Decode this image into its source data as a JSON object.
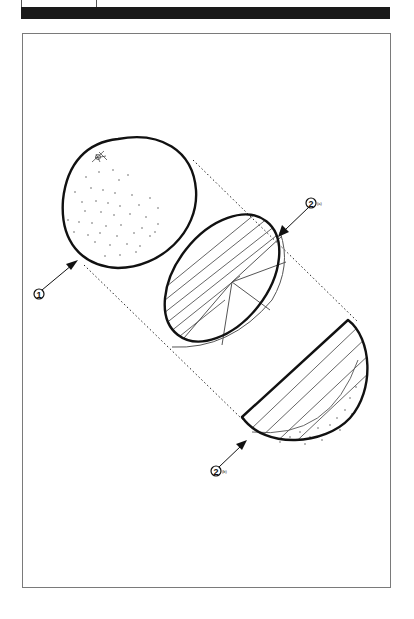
{
  "figure": {
    "callouts": [
      {
        "id": "callout-1",
        "number": "1",
        "suffix": "",
        "target": "whole orange"
      },
      {
        "id": "callout-2a",
        "number": "2",
        "suffix": "(a)",
        "target": "sliced cross-section"
      },
      {
        "id": "callout-2b",
        "number": "2",
        "suffix": "(b)",
        "target": "half wedge"
      }
    ]
  },
  "colors": {
    "ink": "#111111",
    "frame": "#7a7a7a",
    "bar": "#1a1a1a",
    "background": "#ffffff"
  }
}
